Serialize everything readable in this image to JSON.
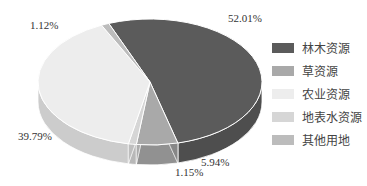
{
  "chart_data": {
    "type": "pie",
    "style": "3d",
    "title": "",
    "categories": [
      "林木资源",
      "草资源",
      "农业资源",
      "地表水资源",
      "其他用地"
    ],
    "values": [
      52.01,
      5.94,
      39.79,
      1.15,
      1.12
    ],
    "value_labels": [
      "52.01%",
      "5.94%",
      "39.79%",
      "1.15%",
      "1.12%"
    ],
    "colors": [
      "#5b5b5b",
      "#a9a9a9",
      "#ededed",
      "#d6d6d6",
      "#bcbcbc"
    ],
    "legend_position": "right"
  },
  "legend": {
    "items": [
      {
        "label": "林木资源",
        "color": "#5b5b5b"
      },
      {
        "label": "草资源",
        "color": "#a9a9a9"
      },
      {
        "label": "农业资源",
        "color": "#ededed"
      },
      {
        "label": "地表水资源",
        "color": "#d6d6d6"
      },
      {
        "label": "其他用地",
        "color": "#bcbcbc"
      }
    ]
  },
  "labels": {
    "forest": "52.01%",
    "grass": "5.94%",
    "agri": "39.79%",
    "water": "1.15%",
    "other": "1.12%"
  }
}
